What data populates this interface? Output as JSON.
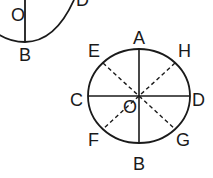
{
  "diagram": {
    "type": "circle-geometry",
    "stroke_color": "#1a1a1a",
    "background": "#ffffff",
    "partial_circle": {
      "description": "Clipped circle at top-left with vertical radius",
      "labels": {
        "center": "O",
        "bottom": "B",
        "right": "D"
      }
    },
    "main_circle": {
      "description": "Circle with center O, solid diameters AB and CD, dashed diameters EG and HF",
      "labels": {
        "top": "A",
        "bottom": "B",
        "left": "C",
        "right": "D",
        "upper_left": "E",
        "upper_right": "H",
        "lower_left": "F",
        "lower_right": "G",
        "center": "O"
      },
      "solid_lines": [
        "AB",
        "CD"
      ],
      "dashed_lines": [
        "EG",
        "HF"
      ]
    }
  }
}
